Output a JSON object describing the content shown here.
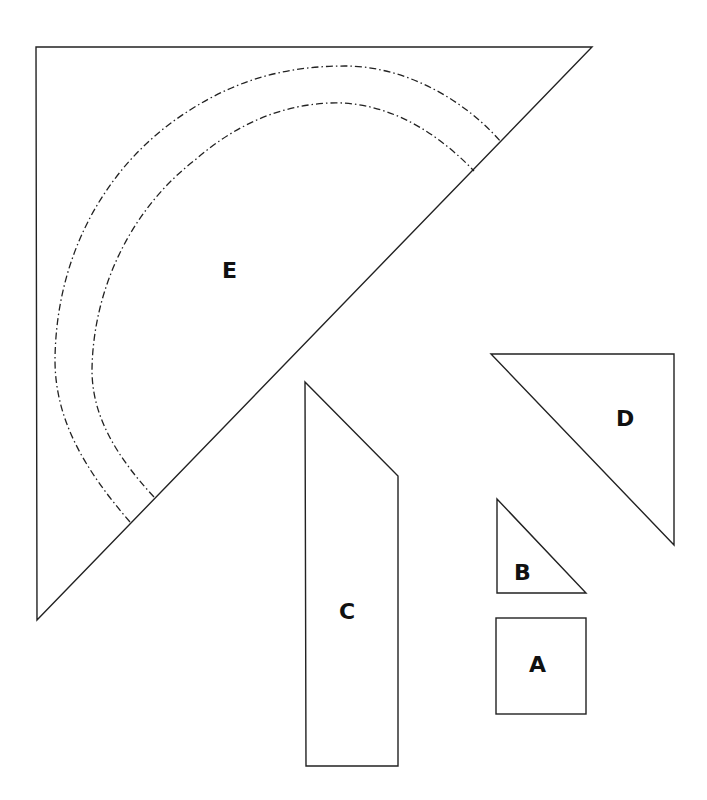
{
  "diagram": {
    "colors": {
      "stroke": "#222222",
      "background": "#ffffff",
      "label": "#111111"
    },
    "pieces": [
      {
        "id": "E",
        "label": "E",
        "shape": "right triangle with two dash-dot concentric arcs"
      },
      {
        "id": "C",
        "label": "C",
        "shape": "trapezoid strip with slanted top"
      },
      {
        "id": "D",
        "label": "D",
        "shape": "right triangle"
      },
      {
        "id": "B",
        "label": "B",
        "shape": "small right triangle"
      },
      {
        "id": "A",
        "label": "A",
        "shape": "square"
      }
    ]
  }
}
